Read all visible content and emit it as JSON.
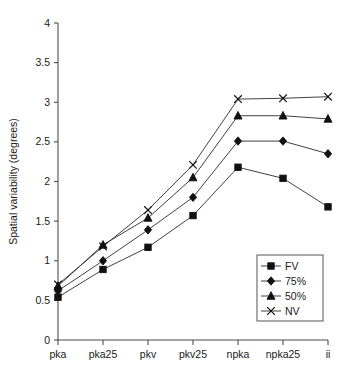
{
  "chart_data": {
    "type": "line",
    "title": "",
    "xlabel": "",
    "ylabel": "Spatial variability (degrees)",
    "categories": [
      "pka",
      "pka25",
      "pkv",
      "pkv25",
      "npka",
      "npka25",
      "ii"
    ],
    "ylim": [
      0,
      4
    ],
    "yticks": [
      "0",
      "0.5",
      "1",
      "1.5",
      "2",
      "2.5",
      "3",
      "3.5",
      "4"
    ],
    "ytick_values": [
      0,
      0.5,
      1,
      1.5,
      2,
      2.5,
      3,
      3.5,
      4
    ],
    "grid": false,
    "legend_position": "bottom-right",
    "series": [
      {
        "name": "FV",
        "marker": "square",
        "values": [
          0.54,
          0.89,
          1.17,
          1.57,
          2.18,
          2.04,
          1.68
        ]
      },
      {
        "name": "75%",
        "marker": "diamond",
        "values": [
          0.62,
          1.0,
          1.39,
          1.8,
          2.51,
          2.51,
          2.35
        ]
      },
      {
        "name": "50%",
        "marker": "triangle",
        "values": [
          0.68,
          1.2,
          1.54,
          2.05,
          2.83,
          2.83,
          2.79
        ]
      },
      {
        "name": "NV",
        "marker": "cross",
        "values": [
          0.7,
          1.18,
          1.64,
          2.21,
          3.04,
          3.05,
          3.07
        ]
      }
    ]
  },
  "legend": {
    "entries": [
      {
        "label": "FV"
      },
      {
        "label": "75%"
      },
      {
        "label": "50%"
      },
      {
        "label": "NV"
      }
    ]
  }
}
